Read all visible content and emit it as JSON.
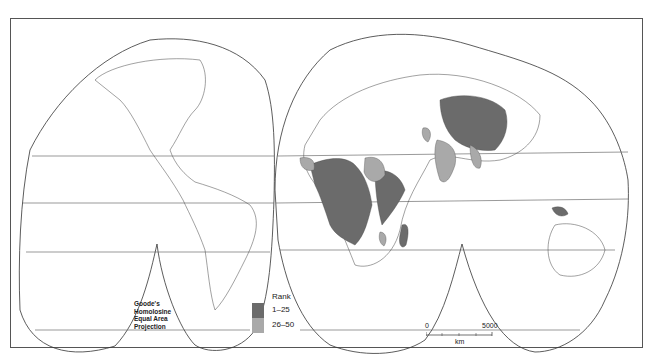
{
  "map": {
    "projection_label": [
      "Goode's",
      "Homolosine",
      "Equal Area",
      "Projection"
    ],
    "scale_bar": {
      "start": "0",
      "end": "5000",
      "unit": "km"
    },
    "legend": {
      "title": "Rank",
      "classes": [
        {
          "label": "1–25",
          "color": "#6b6b6b"
        },
        {
          "label": "26–50",
          "color": "#a9a9a9"
        }
      ]
    },
    "colors": {
      "rank_1_25": "#6b6b6b",
      "rank_26_50": "#a9a9a9",
      "outline": "#333333",
      "background": "#ffffff"
    },
    "shaded_regions": {
      "rank_1_25": [
        "Central Africa",
        "West Africa (part)",
        "East Africa",
        "Madagascar",
        "China",
        "Papua New Guinea"
      ],
      "rank_26_50": [
        "Sudan",
        "India",
        "Southeast Asia (part)",
        "Pakistan/Afghanistan area",
        "West Africa (part)",
        "Mozambique area"
      ]
    }
  }
}
